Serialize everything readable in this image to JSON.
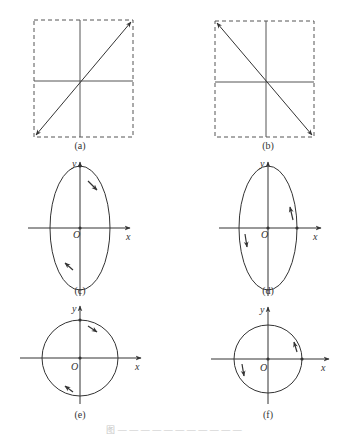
{
  "figure": {
    "caption": "图 — — — — — — — — — — —",
    "stroke_color": "#333333",
    "panels": [
      {
        "id": "a",
        "label": "(a)",
        "type": "linear-polarization",
        "direction": "bottom-left ↔ top-right"
      },
      {
        "id": "b",
        "label": "(b)",
        "type": "linear-polarization",
        "direction": "top-left ↔ bottom-right"
      },
      {
        "id": "c",
        "label": "(c)",
        "type": "elliptical",
        "rotation": "clockwise",
        "x_label": "x",
        "y_label": "y",
        "origin_label": "O"
      },
      {
        "id": "d",
        "label": "(d)",
        "type": "elliptical",
        "rotation": "counterclockwise",
        "x_label": "x",
        "y_label": "y",
        "origin_label": "O"
      },
      {
        "id": "e",
        "label": "(e)",
        "type": "circular",
        "rotation": "clockwise",
        "x_label": "x",
        "y_label": "y",
        "origin_label": "O"
      },
      {
        "id": "f",
        "label": "(f)",
        "type": "circular",
        "rotation": "counterclockwise",
        "x_label": "x",
        "y_label": "y",
        "origin_label": "O"
      }
    ]
  }
}
